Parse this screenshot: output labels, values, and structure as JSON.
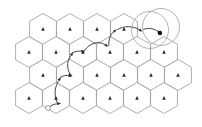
{
  "figure": {
    "kind": "diagram",
    "width": 202,
    "height": 127,
    "background_color": "#ffffff"
  },
  "style": {
    "hex_stroke_color": "#8d8d8d",
    "hex_fill_color": "#ffffff",
    "marker_color": "#2b2b2b",
    "path_color": "#262626",
    "ring_color": "#9a9a9a",
    "start_node_fill": "#ffffff",
    "end_node_fill": "#111111"
  },
  "grid": {
    "name": "honeycomb-grid",
    "orientation": "pointy-top",
    "hex_radius": 15.5,
    "row_count": 4,
    "rows": [
      {
        "index": 0,
        "cell_count": 4,
        "x_start": 43,
        "y": 29,
        "x_step": 27,
        "cells": [
          {
            "id": "r0c0",
            "cx": 43,
            "cy": 29,
            "marker": "triangle-up"
          },
          {
            "id": "r0c1",
            "cx": 70,
            "cy": 29,
            "marker": "triangle-up"
          },
          {
            "id": "r0c2",
            "cx": 97,
            "cy": 29,
            "marker": "triangle-up"
          },
          {
            "id": "r0c3",
            "cx": 124,
            "cy": 29,
            "marker": "triangle-up"
          }
        ]
      },
      {
        "index": 1,
        "cell_count": 6,
        "x_start": 29,
        "y": 52,
        "x_step": 27,
        "cells": [
          {
            "id": "r1c0",
            "cx": 29,
            "cy": 52,
            "marker": "triangle-up"
          },
          {
            "id": "r1c1",
            "cx": 56,
            "cy": 52,
            "marker": "triangle-up"
          },
          {
            "id": "r1c2",
            "cx": 83,
            "cy": 52,
            "marker": "triangle-up"
          },
          {
            "id": "r1c3",
            "cx": 110,
            "cy": 52,
            "marker": "triangle-up"
          },
          {
            "id": "r1c4",
            "cx": 137,
            "cy": 52,
            "marker": "triangle-up"
          },
          {
            "id": "r1c5",
            "cx": 164,
            "cy": 52,
            "marker": "triangle-up"
          }
        ]
      },
      {
        "index": 2,
        "cell_count": 6,
        "x_start": 43,
        "y": 75,
        "x_step": 27,
        "cells": [
          {
            "id": "r2c0",
            "cx": 43,
            "cy": 75,
            "marker": "triangle-up"
          },
          {
            "id": "r2c1",
            "cx": 70,
            "cy": 75,
            "marker": "triangle-up"
          },
          {
            "id": "r2c2",
            "cx": 97,
            "cy": 75,
            "marker": "triangle-up"
          },
          {
            "id": "r2c3",
            "cx": 124,
            "cy": 75,
            "marker": "triangle-up"
          },
          {
            "id": "r2c4",
            "cx": 151,
            "cy": 75,
            "marker": "triangle-up"
          },
          {
            "id": "r2c5",
            "cx": 178,
            "cy": 75,
            "marker": "triangle-up"
          }
        ]
      },
      {
        "index": 3,
        "cell_count": 6,
        "x_start": 29,
        "y": 98,
        "x_step": 27,
        "cells": [
          {
            "id": "r3c0",
            "cx": 29,
            "cy": 98,
            "marker": "triangle-up"
          },
          {
            "id": "r3c1",
            "cx": 56,
            "cy": 98,
            "marker": "triangle-up"
          },
          {
            "id": "r3c2",
            "cx": 83,
            "cy": 98,
            "marker": "triangle-up"
          },
          {
            "id": "r3c3",
            "cx": 110,
            "cy": 98,
            "marker": "triangle-up"
          },
          {
            "id": "r3c4",
            "cx": 137,
            "cy": 98,
            "marker": "triangle-up"
          },
          {
            "id": "r3c5",
            "cx": 164,
            "cy": 98,
            "marker": "triangle-up"
          }
        ]
      }
    ]
  },
  "path": {
    "name": "traversal-path",
    "direction": "bottom-left to top-right",
    "start_node": {
      "id": "path-start",
      "x": 48,
      "y": 108,
      "style": "open-circle",
      "radius": 2.4
    },
    "end_node": {
      "id": "path-end",
      "x": 160,
      "y": 33,
      "style": "filled-dot",
      "radius": 2.2
    },
    "waypoints": [
      {
        "x": 48,
        "y": 108
      },
      {
        "x": 58,
        "y": 104
      },
      {
        "x": 58,
        "y": 80
      },
      {
        "x": 70,
        "y": 76
      },
      {
        "x": 70,
        "y": 56
      },
      {
        "x": 82,
        "y": 52
      },
      {
        "x": 106,
        "y": 52
      },
      {
        "x": 112,
        "y": 45
      },
      {
        "x": 118,
        "y": 34
      },
      {
        "x": 140,
        "y": 30
      },
      {
        "x": 160,
        "y": 33
      }
    ],
    "arrow_segments": [
      {
        "id": "seg-1",
        "d": "M 48.5 107.5 C 52 104.5 54.5 104 57.5 103.8",
        "head_at": {
          "x": 58.6,
          "y": 103.6
        },
        "head_angle": -8
      },
      {
        "id": "seg-2",
        "d": "M 57.2 102.6 C 53.5 95 55 86.5 58.6 80.6",
        "head_at": {
          "x": 59.6,
          "y": 79.2
        },
        "head_angle": -57
      },
      {
        "id": "seg-3",
        "d": "M 60.5 77.2 C 63.5 75.6 66 75.2 69 75.2",
        "head_at": {
          "x": 70.2,
          "y": 75.2
        },
        "head_angle": 0
      },
      {
        "id": "seg-4",
        "d": "M 69.8 73.6 C 66 66.5 67.5 60 70.8 55.6",
        "head_at": {
          "x": 71.8,
          "y": 54.2
        },
        "head_angle": -56
      },
      {
        "id": "seg-5",
        "d": "M 73 52.4 C 76 51.2 78.5 51 81.6 51.2",
        "head_at": {
          "x": 82.8,
          "y": 51.3
        },
        "head_angle": -4
      },
      {
        "id": "seg-6",
        "d": "M 84.5 50.4 C 90 43 98 40.5 105 44.5",
        "head_at": {
          "x": 106.2,
          "y": 45.4
        },
        "head_angle": 40
      },
      {
        "id": "seg-7",
        "d": "M 108.8 45.6 C 108.4 40 110 35 113.5 31.8",
        "head_at": {
          "x": 114.8,
          "y": 30.9
        },
        "head_angle": -44
      },
      {
        "id": "seg-8",
        "d": "M 117.5 29.6 C 124 25.5 133 25.8 139.2 29.6",
        "head_at": {
          "x": 140.4,
          "y": 30.4
        },
        "head_angle": 35
      },
      {
        "id": "seg-9",
        "d": "M 143.5 29.4 C 148.5 27.5 154 28.5 158 31.4",
        "head_at": {
          "x": 159,
          "y": 32.2
        },
        "head_angle": 38
      }
    ],
    "intermediate_dots": [
      {
        "x": 58.6,
        "y": 103.6
      },
      {
        "x": 59.6,
        "y": 79.2
      },
      {
        "x": 71.8,
        "y": 54.2
      },
      {
        "x": 82.8,
        "y": 51.3
      },
      {
        "x": 106.2,
        "y": 45.4
      },
      {
        "x": 114.8,
        "y": 30.9
      },
      {
        "x": 140.4,
        "y": 30.4
      }
    ]
  },
  "highlight": {
    "name": "target-region-rings",
    "description": "Two overlapping circles marking the destination cell",
    "circles": [
      {
        "id": "ring-outer-left",
        "cx": 150,
        "cy": 30,
        "r": 18.5
      },
      {
        "id": "ring-outer-right",
        "cx": 161,
        "cy": 27,
        "r": 18.5
      }
    ]
  },
  "labels": {
    "caption": ""
  }
}
